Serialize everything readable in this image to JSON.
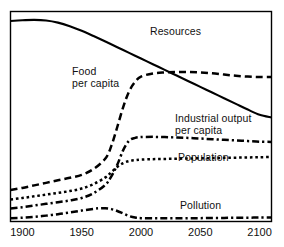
{
  "chart_data": {
    "type": "line",
    "title": "",
    "subtitle": "",
    "xlabel": "",
    "ylabel": "",
    "xlim": [
      1890,
      2110
    ],
    "ylim": [
      0,
      1
    ],
    "grid": false,
    "legend_position": "inline-annotations",
    "x_ticks": [
      "1900",
      "1950",
      "2000",
      "2050",
      "2100"
    ],
    "x_tick_values": [
      1900,
      1950,
      2000,
      2050,
      2100
    ],
    "y_ticks": [],
    "axis_note": "Vertical axis is unlabeled and unitless; values are relative indices.",
    "series": [
      {
        "name": "Resources",
        "label": "Resources",
        "label_lines": [
          "Resources"
        ],
        "line_style": "solid",
        "color": "#000000",
        "x": [
          1890,
          1900,
          1910,
          1920,
          1930,
          1940,
          1950,
          1960,
          1970,
          1980,
          1990,
          2000,
          2010,
          2020,
          2030,
          2040,
          2050,
          2060,
          2070,
          2080,
          2090,
          2100,
          2110
        ],
        "values": [
          0.955,
          0.958,
          0.96,
          0.957,
          0.947,
          0.93,
          0.908,
          0.883,
          0.857,
          0.83,
          0.803,
          0.776,
          0.749,
          0.722,
          0.695,
          0.668,
          0.641,
          0.614,
          0.587,
          0.56,
          0.533,
          0.508,
          0.495
        ]
      },
      {
        "name": "Food per capita",
        "label": "Food per capita",
        "label_lines": [
          "Food",
          "per capita"
        ],
        "line_style": "dashed",
        "color": "#000000",
        "x": [
          1890,
          1900,
          1910,
          1920,
          1930,
          1940,
          1950,
          1960,
          1970,
          1975,
          1980,
          1985,
          1990,
          1995,
          2000,
          2010,
          2020,
          2030,
          2040,
          2050,
          2060,
          2070,
          2080,
          2090,
          2100,
          2110
        ],
        "values": [
          0.15,
          0.16,
          0.172,
          0.184,
          0.196,
          0.208,
          0.222,
          0.25,
          0.3,
          0.36,
          0.45,
          0.545,
          0.62,
          0.665,
          0.69,
          0.705,
          0.71,
          0.712,
          0.712,
          0.71,
          0.706,
          0.7,
          0.694,
          0.69,
          0.688,
          0.688
        ]
      },
      {
        "name": "Industrial output per capita",
        "label": "Industrial output per capita",
        "label_lines": [
          "Industrial output",
          "per capita"
        ],
        "line_style": "dash-dot",
        "color": "#000000",
        "x": [
          1890,
          1900,
          1910,
          1920,
          1930,
          1940,
          1950,
          1960,
          1970,
          1975,
          1980,
          1985,
          1990,
          1995,
          2000,
          2010,
          2020,
          2030,
          2040,
          2050,
          2060,
          2070,
          2080,
          2090,
          2100,
          2110
        ],
        "values": [
          0.062,
          0.068,
          0.076,
          0.084,
          0.092,
          0.1,
          0.112,
          0.135,
          0.175,
          0.215,
          0.27,
          0.34,
          0.385,
          0.398,
          0.402,
          0.403,
          0.402,
          0.4,
          0.398,
          0.395,
          0.392,
          0.389,
          0.386,
          0.383,
          0.38,
          0.379
        ]
      },
      {
        "name": "Population",
        "label": "Population",
        "label_lines": [
          "Population"
        ],
        "line_style": "dotted",
        "color": "#000000",
        "x": [
          1890,
          1900,
          1910,
          1920,
          1930,
          1940,
          1950,
          1960,
          1970,
          1975,
          1980,
          1985,
          1990,
          1995,
          2000,
          2010,
          2020,
          2030,
          2040,
          2050,
          2060,
          2070,
          2080,
          2090,
          2100,
          2110
        ],
        "values": [
          0.105,
          0.112,
          0.12,
          0.128,
          0.136,
          0.145,
          0.157,
          0.178,
          0.21,
          0.235,
          0.26,
          0.278,
          0.288,
          0.292,
          0.295,
          0.297,
          0.298,
          0.299,
          0.3,
          0.301,
          0.302,
          0.303,
          0.304,
          0.305,
          0.306,
          0.307
        ]
      },
      {
        "name": "Pollution",
        "label": "Pollution",
        "label_lines": [
          "Pollution"
        ],
        "line_style": "dash-dot",
        "color": "#000000",
        "x": [
          1890,
          1900,
          1910,
          1920,
          1930,
          1940,
          1950,
          1960,
          1965,
          1970,
          1975,
          1980,
          1985,
          1990,
          1995,
          2000,
          2010,
          2020,
          2030,
          2040,
          2050,
          2060,
          2070,
          2080,
          2090,
          2100,
          2110
        ],
        "values": [
          0.016,
          0.018,
          0.022,
          0.028,
          0.035,
          0.043,
          0.052,
          0.06,
          0.063,
          0.063,
          0.059,
          0.05,
          0.038,
          0.026,
          0.019,
          0.016,
          0.015,
          0.015,
          0.015,
          0.016,
          0.016,
          0.017,
          0.017,
          0.018,
          0.018,
          0.019,
          0.019
        ]
      }
    ]
  },
  "axis": {
    "frame_color": "#000000",
    "tick_labels": [
      "1900",
      "1950",
      "2000",
      "2050",
      "2100"
    ]
  },
  "labels": {
    "resources": "Resources",
    "food_line1": "Food",
    "food_line2": "per capita",
    "industrial_line1": "Industrial output",
    "industrial_line2": "per capita",
    "population": "Population",
    "pollution": "Pollution"
  }
}
